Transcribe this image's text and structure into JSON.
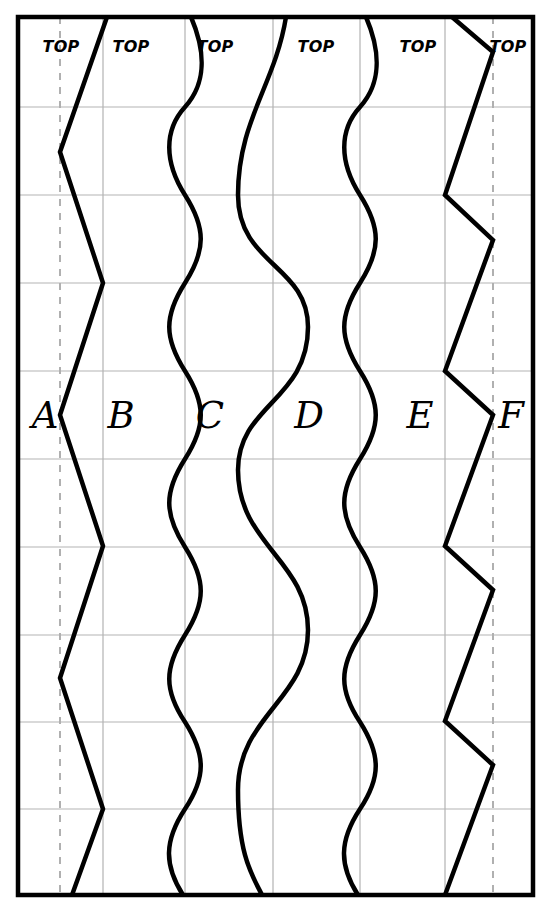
{
  "figure": {
    "width": 551,
    "height": 913,
    "background_color": "#ffffff"
  },
  "colors": {
    "outline": "#000000",
    "seam_line": "#000000",
    "grid_line": "#b3b3b3",
    "dashed_guide": "#b0b0b0",
    "text": "#000000",
    "background": "#ffffff"
  },
  "frame": {
    "left": 18,
    "right": 533,
    "top": 17,
    "bottom": 895,
    "stroke_width": 4
  },
  "grid": {
    "vertical_x": [
      103,
      185,
      273,
      360,
      445
    ],
    "horizontal_y": [
      107,
      195,
      283,
      371,
      459,
      535,
      623,
      710,
      797
    ],
    "stroke_width": 1.2,
    "visible": true
  },
  "dashed_guides": {
    "x_positions": [
      60,
      493
    ],
    "stroke_width": 2,
    "dash_pattern": "7 7"
  },
  "top_labels": [
    {
      "text": "TOP",
      "x": 61,
      "y": 52
    },
    {
      "text": "TOP",
      "x": 131,
      "y": 52
    },
    {
      "text": "TOP",
      "x": 215,
      "y": 52
    },
    {
      "text": "TOP",
      "x": 316,
      "y": 52
    },
    {
      "text": "TOP",
      "x": 418,
      "y": 52
    },
    {
      "text": "TOP",
      "x": 508,
      "y": 52
    }
  ],
  "panel_letters": [
    {
      "text": "A",
      "x": 45,
      "y": 428
    },
    {
      "text": "B",
      "x": 121,
      "y": 428
    },
    {
      "text": "C",
      "x": 210,
      "y": 428
    },
    {
      "text": "D",
      "x": 309,
      "y": 428
    },
    {
      "text": "E",
      "x": 420,
      "y": 428
    },
    {
      "text": "F",
      "x": 511,
      "y": 428
    }
  ],
  "seams": [
    {
      "name": "seam-a-b",
      "style": "zigzag",
      "stroke_width": 4.5,
      "x_min": 60,
      "x_max": 103,
      "points": "107,17 60,152 103,283 60,415 103,546 60,678 103,809 72,895"
    },
    {
      "name": "seam-b-c",
      "style": "wave-small",
      "stroke_width": 4.5,
      "center_x": 185,
      "amplitude": 21,
      "period": 176,
      "phase_top": "crest-right"
    },
    {
      "name": "seam-c-d",
      "style": "wave-large",
      "stroke_width": 4.5,
      "center_x": 273,
      "amplitude": 35,
      "period": 352,
      "phase_top": "crest-right"
    },
    {
      "name": "seam-d-e",
      "style": "wave-small",
      "stroke_width": 4.5,
      "center_x": 360,
      "amplitude": 21,
      "period": 176,
      "phase_top": "crest-right"
    },
    {
      "name": "seam-e-f",
      "style": "zigzag",
      "stroke_width": 4.5,
      "x_min": 445,
      "x_max": 493,
      "points": "452,17 493,52 445,195 493,240 445,371 493,415 445,546 493,590 445,721 493,765 445,895"
    }
  ]
}
